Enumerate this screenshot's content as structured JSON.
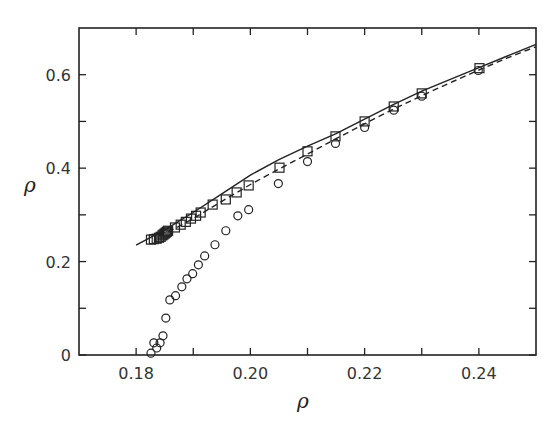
{
  "chart_data": {
    "type": "scatter",
    "title": "",
    "xlabel": "ρ",
    "ylabel": "ρ",
    "xlim": [
      0.17,
      0.25
    ],
    "ylim": [
      0,
      0.7
    ],
    "grid": false,
    "legend": null,
    "x_ticks": [
      0.18,
      0.19,
      0.2,
      0.21,
      0.22,
      0.23,
      0.24
    ],
    "x_tick_labels": [
      "0.18",
      "",
      "0.20",
      "",
      "0.22",
      "",
      "0.24"
    ],
    "y_ticks": [
      0,
      0.1,
      0.2,
      0.3,
      0.4,
      0.5,
      0.6
    ],
    "y_tick_labels": [
      "0",
      "",
      "0.2",
      "",
      "0.4",
      "",
      "0.6"
    ],
    "series": [
      {
        "name": "squares",
        "marker": "square",
        "style": "open",
        "points": [
          [
            0.1826,
            0.247
          ],
          [
            0.1831,
            0.248
          ],
          [
            0.1836,
            0.249
          ],
          [
            0.184,
            0.251
          ],
          [
            0.1843,
            0.253
          ],
          [
            0.1846,
            0.256
          ],
          [
            0.1848,
            0.258
          ],
          [
            0.185,
            0.26
          ],
          [
            0.1852,
            0.262
          ],
          [
            0.1854,
            0.264
          ],
          [
            0.1856,
            0.266
          ],
          [
            0.1868,
            0.273
          ],
          [
            0.1878,
            0.279
          ],
          [
            0.1887,
            0.285
          ],
          [
            0.1896,
            0.292
          ],
          [
            0.1905,
            0.298
          ],
          [
            0.1913,
            0.305
          ],
          [
            0.1934,
            0.322
          ],
          [
            0.1957,
            0.333
          ],
          [
            0.1976,
            0.348
          ],
          [
            0.1997,
            0.363
          ],
          [
            0.2051,
            0.401
          ],
          [
            0.21,
            0.436
          ],
          [
            0.2149,
            0.468
          ],
          [
            0.22,
            0.5
          ],
          [
            0.2251,
            0.532
          ],
          [
            0.23,
            0.56
          ],
          [
            0.2401,
            0.614
          ]
        ]
      },
      {
        "name": "circles",
        "marker": "circle",
        "style": "open",
        "points": [
          [
            0.1826,
            0.004
          ],
          [
            0.1831,
            0.026
          ],
          [
            0.1836,
            0.015
          ],
          [
            0.1842,
            0.026
          ],
          [
            0.1847,
            0.041
          ],
          [
            0.1852,
            0.079
          ],
          [
            0.1859,
            0.118
          ],
          [
            0.1869,
            0.127
          ],
          [
            0.188,
            0.146
          ],
          [
            0.1889,
            0.163
          ],
          [
            0.1899,
            0.174
          ],
          [
            0.1909,
            0.193
          ],
          [
            0.192,
            0.212
          ],
          [
            0.1938,
            0.236
          ],
          [
            0.1957,
            0.266
          ],
          [
            0.1978,
            0.298
          ],
          [
            0.1997,
            0.311
          ],
          [
            0.2049,
            0.367
          ],
          [
            0.21,
            0.414
          ],
          [
            0.2149,
            0.453
          ],
          [
            0.22,
            0.487
          ],
          [
            0.2251,
            0.524
          ],
          [
            0.23,
            0.554
          ],
          [
            0.2399,
            0.609
          ]
        ]
      },
      {
        "name": "solid-line",
        "type": "line",
        "dash": "solid",
        "points": [
          [
            0.18,
            0.235
          ],
          [
            0.185,
            0.268
          ],
          [
            0.19,
            0.305
          ],
          [
            0.195,
            0.345
          ],
          [
            0.2,
            0.385
          ],
          [
            0.205,
            0.418
          ],
          [
            0.21,
            0.447
          ],
          [
            0.215,
            0.474
          ],
          [
            0.22,
            0.505
          ],
          [
            0.225,
            0.536
          ],
          [
            0.23,
            0.565
          ],
          [
            0.235,
            0.59
          ],
          [
            0.24,
            0.615
          ],
          [
            0.245,
            0.64
          ],
          [
            0.25,
            0.665
          ]
        ]
      },
      {
        "name": "dashed-line",
        "type": "line",
        "dash": "dashed",
        "points": [
          [
            0.184,
            0.255
          ],
          [
            0.187,
            0.272
          ],
          [
            0.19,
            0.292
          ],
          [
            0.195,
            0.329
          ],
          [
            0.2,
            0.365
          ],
          [
            0.205,
            0.398
          ],
          [
            0.21,
            0.43
          ],
          [
            0.215,
            0.463
          ],
          [
            0.22,
            0.495
          ],
          [
            0.225,
            0.526
          ],
          [
            0.23,
            0.555
          ],
          [
            0.235,
            0.583
          ],
          [
            0.24,
            0.61
          ],
          [
            0.245,
            0.636
          ],
          [
            0.25,
            0.66
          ]
        ]
      }
    ]
  },
  "plot_area": {
    "left": 79,
    "top": 28,
    "right": 536,
    "bottom": 355
  },
  "colors": {
    "ink": "#222222",
    "background": "#ffffff"
  }
}
